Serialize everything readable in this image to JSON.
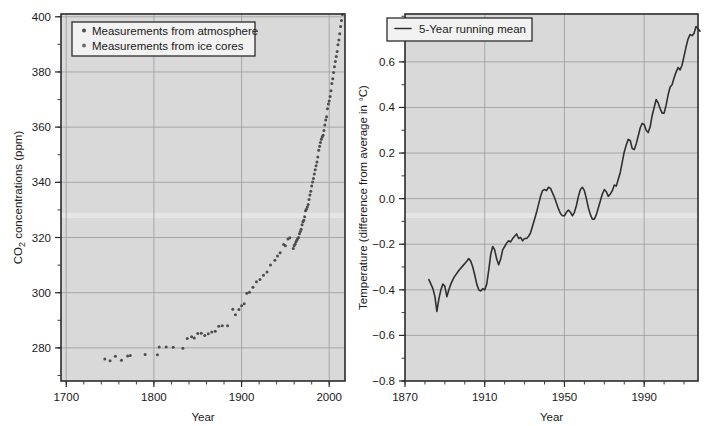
{
  "figure": {
    "background": "#ffffff",
    "plot_background": "#d9d9d9",
    "grid_color": "#9a9a9a",
    "axis_color": "#2b2b2b",
    "marker_color": "#4d4d4d",
    "line_color": "#303030"
  },
  "chart_data": [
    {
      "type": "scatter",
      "title": "",
      "xlabel": "Year",
      "ylabel": "CO2 concentrations (ppm)",
      "ylabel_parts": {
        "pre": "CO",
        "sub": "2",
        "post": " concentrations (ppm)"
      },
      "xlim": [
        1694,
        2018
      ],
      "ylim": [
        268,
        401
      ],
      "xticks": [
        1700,
        1800,
        1900,
        2000
      ],
      "xtick_labels": [
        "1700",
        "1800",
        "1900",
        "2000"
      ],
      "xticks_minor_step": 20,
      "yticks": [
        280,
        300,
        320,
        340,
        360,
        380,
        400
      ],
      "ytick_labels": [
        "280",
        "300",
        "320",
        "340",
        "360",
        "380",
        "400"
      ],
      "yticks_minor_step": 10,
      "grid": true,
      "legend_position": "upper left",
      "legend": [
        {
          "label": "Measurements from atmosphere",
          "marker": "circle",
          "color": "#4d4d4d"
        },
        {
          "label": "Measurements from ice cores",
          "marker": "circle",
          "color": "#6e6e6e"
        }
      ],
      "series": [
        {
          "name": "Measurements from ice cores",
          "marker": "circle",
          "points": [
            [
              1744,
              276.0
            ],
            [
              1750,
              275.3
            ],
            [
              1756,
              277.0
            ],
            [
              1763,
              275.5
            ],
            [
              1770,
              277.1
            ],
            [
              1773,
              277.2
            ],
            [
              1790,
              277.6
            ],
            [
              1804,
              277.5
            ],
            [
              1806,
              280.3
            ],
            [
              1814,
              280.3
            ],
            [
              1822,
              280.2
            ],
            [
              1833,
              279.9
            ],
            [
              1838,
              283.4
            ],
            [
              1843,
              284.0
            ],
            [
              1846,
              283.6
            ],
            [
              1850,
              285.2
            ],
            [
              1854,
              285.3
            ],
            [
              1858,
              284.5
            ],
            [
              1862,
              285.1
            ],
            [
              1866,
              285.8
            ],
            [
              1870,
              286.0
            ],
            [
              1874,
              287.8
            ],
            [
              1878,
              288.0
            ],
            [
              1884,
              288.0
            ],
            [
              1890,
              294.0
            ],
            [
              1893,
              292.0
            ],
            [
              1897,
              293.9
            ],
            [
              1900,
              295.3
            ],
            [
              1903,
              296.0
            ],
            [
              1906,
              299.8
            ],
            [
              1909,
              300.2
            ],
            [
              1913,
              302.0
            ],
            [
              1917,
              304.0
            ],
            [
              1921,
              304.8
            ],
            [
              1925,
              306.3
            ],
            [
              1929,
              307.5
            ],
            [
              1933,
              310.0
            ],
            [
              1938,
              311.8
            ],
            [
              1941,
              313.3
            ],
            [
              1944,
              314.5
            ],
            [
              1948,
              317.5
            ],
            [
              1950,
              317.0
            ],
            [
              1953,
              319.5
            ],
            [
              1955,
              319.9
            ]
          ]
        },
        {
          "name": "Measurements from atmosphere",
          "marker": "circle",
          "points": [
            [
              1959,
              316.0
            ],
            [
              1960,
              317.0
            ],
            [
              1961,
              317.6
            ],
            [
              1962,
              318.4
            ],
            [
              1963,
              319.0
            ],
            [
              1964,
              319.6
            ],
            [
              1965,
              320.0
            ],
            [
              1966,
              321.4
            ],
            [
              1967,
              322.2
            ],
            [
              1968,
              323.0
            ],
            [
              1969,
              324.6
            ],
            [
              1970,
              325.7
            ],
            [
              1971,
              326.3
            ],
            [
              1972,
              327.5
            ],
            [
              1973,
              329.7
            ],
            [
              1974,
              330.2
            ],
            [
              1975,
              331.1
            ],
            [
              1976,
              332.0
            ],
            [
              1977,
              333.8
            ],
            [
              1978,
              335.4
            ],
            [
              1979,
              336.8
            ],
            [
              1980,
              338.7
            ],
            [
              1981,
              340.1
            ],
            [
              1982,
              341.4
            ],
            [
              1983,
              343.0
            ],
            [
              1984,
              344.6
            ],
            [
              1985,
              346.0
            ],
            [
              1986,
              347.4
            ],
            [
              1987,
              349.2
            ],
            [
              1988,
              351.6
            ],
            [
              1989,
              353.1
            ],
            [
              1990,
              354.4
            ],
            [
              1991,
              355.6
            ],
            [
              1992,
              356.4
            ],
            [
              1993,
              357.1
            ],
            [
              1994,
              358.8
            ],
            [
              1995,
              360.8
            ],
            [
              1996,
              362.6
            ],
            [
              1997,
              363.8
            ],
            [
              1998,
              366.7
            ],
            [
              1999,
              368.4
            ],
            [
              2000,
              369.5
            ],
            [
              2001,
              371.1
            ],
            [
              2002,
              373.2
            ],
            [
              2003,
              375.8
            ],
            [
              2004,
              377.5
            ],
            [
              2005,
              379.8
            ],
            [
              2006,
              381.9
            ],
            [
              2007,
              383.8
            ],
            [
              2008,
              385.6
            ],
            [
              2009,
              387.4
            ],
            [
              2010,
              389.9
            ],
            [
              2011,
              391.6
            ],
            [
              2012,
              393.8
            ],
            [
              2013,
              396.5
            ],
            [
              2014,
              398.6
            ],
            [
              2015,
              400.8
            ]
          ]
        }
      ]
    },
    {
      "type": "line",
      "title": "",
      "xlabel": "Year",
      "ylabel": "Temperature (difference from average in °C)",
      "xlim": [
        1870,
        2017
      ],
      "ylim": [
        -0.8,
        0.81
      ],
      "xticks": [
        1870,
        1910,
        1950,
        1990
      ],
      "xtick_labels": [
        "1870",
        "1910",
        "1950",
        "1990"
      ],
      "xticks_minor_step": 10,
      "yticks": [
        -0.8,
        -0.6,
        -0.4,
        -0.2,
        0.0,
        0.2,
        0.4,
        0.6
      ],
      "ytick_labels": [
        "−0.8",
        "−0.6",
        "−0.4",
        "−0.2",
        "0.0",
        "0.2",
        "0.4",
        "0.6"
      ],
      "yticks_minor_step": 0.1,
      "grid": true,
      "legend_position": "upper left",
      "legend": [
        {
          "label": "5-Year running mean",
          "marker": "line",
          "color": "#303030"
        }
      ],
      "series": [
        {
          "name": "5-Year running mean",
          "marker": "line",
          "points": [
            [
              1882,
              -0.355
            ],
            [
              1884,
              -0.395
            ],
            [
              1885,
              -0.43
            ],
            [
              1886,
              -0.495
            ],
            [
              1887,
              -0.44
            ],
            [
              1888,
              -0.4
            ],
            [
              1889,
              -0.375
            ],
            [
              1890,
              -0.385
            ],
            [
              1891,
              -0.43
            ],
            [
              1892,
              -0.4
            ],
            [
              1893,
              -0.375
            ],
            [
              1894,
              -0.355
            ],
            [
              1895,
              -0.34
            ],
            [
              1897,
              -0.315
            ],
            [
              1899,
              -0.295
            ],
            [
              1901,
              -0.275
            ],
            [
              1902,
              -0.263
            ],
            [
              1903,
              -0.275
            ],
            [
              1904,
              -0.3
            ],
            [
              1905,
              -0.335
            ],
            [
              1906,
              -0.375
            ],
            [
              1907,
              -0.4
            ],
            [
              1908,
              -0.405
            ],
            [
              1909,
              -0.395
            ],
            [
              1910,
              -0.4
            ],
            [
              1911,
              -0.375
            ],
            [
              1912,
              -0.315
            ],
            [
              1913,
              -0.245
            ],
            [
              1914,
              -0.21
            ],
            [
              1915,
              -0.225
            ],
            [
              1916,
              -0.265
            ],
            [
              1917,
              -0.29
            ],
            [
              1918,
              -0.265
            ],
            [
              1919,
              -0.225
            ],
            [
              1920,
              -0.21
            ],
            [
              1921,
              -0.195
            ],
            [
              1922,
              -0.185
            ],
            [
              1923,
              -0.19
            ],
            [
              1924,
              -0.175
            ],
            [
              1925,
              -0.165
            ],
            [
              1926,
              -0.155
            ],
            [
              1927,
              -0.175
            ],
            [
              1928,
              -0.17
            ],
            [
              1929,
              -0.185
            ],
            [
              1930,
              -0.175
            ],
            [
              1931,
              -0.175
            ],
            [
              1932,
              -0.165
            ],
            [
              1933,
              -0.15
            ],
            [
              1934,
              -0.12
            ],
            [
              1935,
              -0.09
            ],
            [
              1936,
              -0.06
            ],
            [
              1937,
              -0.025
            ],
            [
              1938,
              0.01
            ],
            [
              1939,
              0.035
            ],
            [
              1940,
              0.04
            ],
            [
              1941,
              0.035
            ],
            [
              1942,
              0.05
            ],
            [
              1943,
              0.045
            ],
            [
              1944,
              0.025
            ],
            [
              1945,
              0.005
            ],
            [
              1946,
              -0.02
            ],
            [
              1947,
              -0.045
            ],
            [
              1948,
              -0.065
            ],
            [
              1949,
              -0.075
            ],
            [
              1950,
              -0.075
            ],
            [
              1951,
              -0.06
            ],
            [
              1952,
              -0.05
            ],
            [
              1953,
              -0.06
            ],
            [
              1954,
              -0.075
            ],
            [
              1955,
              -0.06
            ],
            [
              1956,
              -0.03
            ],
            [
              1957,
              0.01
            ],
            [
              1958,
              0.04
            ],
            [
              1959,
              0.05
            ],
            [
              1960,
              0.035
            ],
            [
              1961,
              0.0
            ],
            [
              1962,
              -0.04
            ],
            [
              1963,
              -0.07
            ],
            [
              1964,
              -0.09
            ],
            [
              1965,
              -0.09
            ],
            [
              1966,
              -0.07
            ],
            [
              1967,
              -0.04
            ],
            [
              1968,
              -0.01
            ],
            [
              1969,
              0.02
            ],
            [
              1970,
              0.04
            ],
            [
              1971,
              0.03
            ],
            [
              1972,
              0.01
            ],
            [
              1973,
              0.02
            ],
            [
              1974,
              0.035
            ],
            [
              1975,
              0.06
            ],
            [
              1976,
              0.055
            ],
            [
              1977,
              0.085
            ],
            [
              1978,
              0.115
            ],
            [
              1979,
              0.16
            ],
            [
              1980,
              0.205
            ],
            [
              1981,
              0.235
            ],
            [
              1982,
              0.26
            ],
            [
              1983,
              0.255
            ],
            [
              1984,
              0.22
            ],
            [
              1985,
              0.215
            ],
            [
              1986,
              0.24
            ],
            [
              1987,
              0.275
            ],
            [
              1988,
              0.31
            ],
            [
              1989,
              0.33
            ],
            [
              1990,
              0.325
            ],
            [
              1991,
              0.3
            ],
            [
              1992,
              0.29
            ],
            [
              1993,
              0.315
            ],
            [
              1994,
              0.365
            ],
            [
              1995,
              0.4
            ],
            [
              1996,
              0.435
            ],
            [
              1997,
              0.42
            ],
            [
              1998,
              0.395
            ],
            [
              1999,
              0.375
            ],
            [
              2000,
              0.375
            ],
            [
              2001,
              0.41
            ],
            [
              2002,
              0.455
            ],
            [
              2003,
              0.49
            ],
            [
              2004,
              0.5
            ],
            [
              2005,
              0.53
            ],
            [
              2006,
              0.555
            ],
            [
              2007,
              0.575
            ],
            [
              2008,
              0.565
            ],
            [
              2009,
              0.585
            ],
            [
              2010,
              0.625
            ],
            [
              2011,
              0.665
            ],
            [
              2012,
              0.7
            ],
            [
              2013,
              0.72
            ],
            [
              2014,
              0.715
            ],
            [
              2015,
              0.725
            ],
            [
              2016,
              0.755
            ],
            [
              2017,
              0.745
            ],
            [
              2018,
              0.735
            ]
          ]
        }
      ]
    }
  ]
}
